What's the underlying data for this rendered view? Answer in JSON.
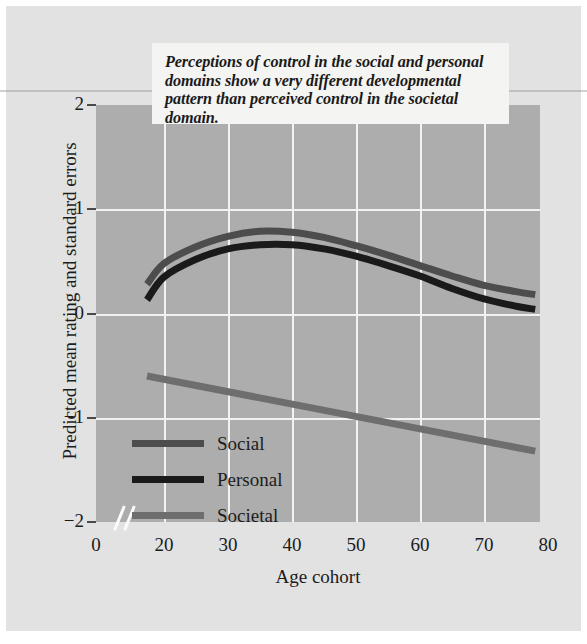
{
  "callout": {
    "text": "Perceptions of control in the social and personal domains show a very different developmental pattern than perceived control in the societal domain."
  },
  "chart_data": {
    "type": "line",
    "title": "",
    "subtitle": "",
    "annotations": [
      "Perceptions of control in the social and personal domains show a very different developmental pattern than perceived control in the societal domain."
    ],
    "xlabel": "Age cohort",
    "ylabel": "Predicted mean rating and standard errors",
    "xlim": [
      0,
      80
    ],
    "ylim": [
      -2,
      2
    ],
    "x_ticks": [
      0,
      20,
      30,
      40,
      50,
      60,
      70,
      80
    ],
    "x_tick_labels": [
      "0",
      "20",
      "30",
      "40",
      "50",
      "60",
      "70",
      "80"
    ],
    "y_ticks": [
      2,
      1,
      0,
      -1,
      -2
    ],
    "y_tick_labels": [
      "2",
      "1",
      "0",
      "−1",
      "−2"
    ],
    "axis_break": true,
    "axis_break_between": [
      0,
      15
    ],
    "grid": true,
    "grid_color": "#f2f2f2",
    "plot_background": "#adadad",
    "legend_position": "inside-lower-left",
    "series": [
      {
        "name": "Social",
        "color": "#4d4d4d",
        "x": [
          15,
          20,
          25,
          30,
          35,
          40,
          45,
          50,
          55,
          60,
          65,
          70,
          75,
          78
        ],
        "values": [
          0.28,
          0.48,
          0.64,
          0.74,
          0.79,
          0.78,
          0.73,
          0.65,
          0.56,
          0.46,
          0.36,
          0.27,
          0.21,
          0.18
        ]
      },
      {
        "name": "Personal",
        "color": "#1a1a1a",
        "x": [
          15,
          20,
          25,
          30,
          35,
          40,
          45,
          50,
          55,
          60,
          65,
          70,
          75,
          78
        ],
        "values": [
          0.13,
          0.35,
          0.52,
          0.62,
          0.66,
          0.66,
          0.62,
          0.55,
          0.46,
          0.36,
          0.24,
          0.14,
          0.07,
          0.04
        ]
      },
      {
        "name": "Societal",
        "color": "#6e6e6e",
        "x": [
          15,
          78
        ],
        "values": [
          -0.6,
          -1.32
        ]
      }
    ]
  },
  "legend": {
    "items": [
      {
        "label": "Social",
        "color": "#4d4d4d"
      },
      {
        "label": "Personal",
        "color": "#1a1a1a"
      },
      {
        "label": "Societal",
        "color": "#6e6e6e"
      }
    ]
  }
}
